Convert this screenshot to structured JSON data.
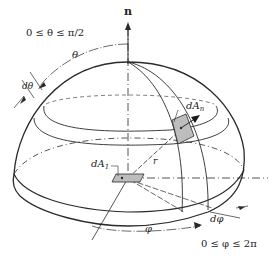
{
  "figure": {
    "type": "hemisphere-solid-angle-diagram",
    "labels": {
      "normal": "n",
      "theta_range": "0 ≤ θ ≤ π/2",
      "theta": "θ",
      "dtheta": "dθ",
      "dAn_main": "dA",
      "dAn_sub": "n",
      "dA1_main": "dA",
      "dA1_sub": "1",
      "r": "r",
      "phi": "φ",
      "dphi": "dφ",
      "phi_range": "0 ≤ φ ≤ 2π"
    },
    "colors": {
      "line": "#2a2a2a",
      "patch_fill": "#bdbdbd",
      "background": "#ffffff"
    }
  }
}
